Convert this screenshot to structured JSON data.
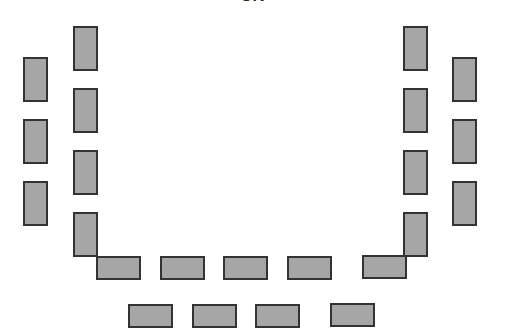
{
  "diagram": {
    "title_fragment": "SK",
    "colors": {
      "desk_fill": "#a6a6a6",
      "desk_border": "#333333",
      "background": "#ffffff"
    },
    "layout": "U-shaped classroom seating arrangement",
    "desks": [
      {
        "id": "left-outer-1",
        "x": 23,
        "y": 57,
        "w": 25,
        "h": 45
      },
      {
        "id": "left-outer-2",
        "x": 23,
        "y": 119,
        "w": 25,
        "h": 45
      },
      {
        "id": "left-outer-3",
        "x": 23,
        "y": 181,
        "w": 25,
        "h": 45
      },
      {
        "id": "left-inner-1",
        "x": 73,
        "y": 26,
        "w": 25,
        "h": 45
      },
      {
        "id": "left-inner-2",
        "x": 73,
        "y": 88,
        "w": 25,
        "h": 45
      },
      {
        "id": "left-inner-3",
        "x": 73,
        "y": 150,
        "w": 25,
        "h": 45
      },
      {
        "id": "left-inner-4",
        "x": 73,
        "y": 212,
        "w": 25,
        "h": 45
      },
      {
        "id": "front-inner-1",
        "x": 96,
        "y": 256,
        "w": 45,
        "h": 24
      },
      {
        "id": "front-inner-2",
        "x": 160,
        "y": 256,
        "w": 45,
        "h": 24
      },
      {
        "id": "front-inner-3",
        "x": 223,
        "y": 256,
        "w": 45,
        "h": 24
      },
      {
        "id": "front-inner-4",
        "x": 287,
        "y": 256,
        "w": 45,
        "h": 24
      },
      {
        "id": "front-inner-5",
        "x": 362,
        "y": 255,
        "w": 45,
        "h": 24
      },
      {
        "id": "right-inner-1",
        "x": 403,
        "y": 26,
        "w": 25,
        "h": 45
      },
      {
        "id": "right-inner-2",
        "x": 403,
        "y": 88,
        "w": 25,
        "h": 45
      },
      {
        "id": "right-inner-3",
        "x": 403,
        "y": 150,
        "w": 25,
        "h": 45
      },
      {
        "id": "right-inner-4",
        "x": 403,
        "y": 212,
        "w": 25,
        "h": 45
      },
      {
        "id": "right-outer-1",
        "x": 452,
        "y": 57,
        "w": 25,
        "h": 45
      },
      {
        "id": "right-outer-2",
        "x": 452,
        "y": 119,
        "w": 25,
        "h": 45
      },
      {
        "id": "right-outer-3",
        "x": 452,
        "y": 181,
        "w": 25,
        "h": 45
      },
      {
        "id": "back-row-1",
        "x": 128,
        "y": 304,
        "w": 45,
        "h": 24
      },
      {
        "id": "back-row-2",
        "x": 192,
        "y": 304,
        "w": 45,
        "h": 24
      },
      {
        "id": "back-row-3",
        "x": 255,
        "y": 304,
        "w": 45,
        "h": 24
      },
      {
        "id": "back-row-4",
        "x": 330,
        "y": 303,
        "w": 45,
        "h": 24
      }
    ]
  }
}
